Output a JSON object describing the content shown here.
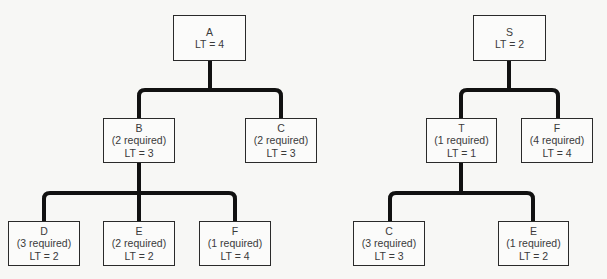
{
  "colors": {
    "line": "#111111",
    "box_border": "#2a2a2a",
    "text": "#3a3a3a",
    "background": "#f7f7f5"
  },
  "trees": [
    {
      "name": "left",
      "nodes": [
        {
          "id": "A",
          "lines": [
            "A",
            "LT = 4"
          ],
          "x": 173,
          "y": 15,
          "w": 73,
          "h": 46
        },
        {
          "id": "B",
          "lines": [
            "B",
            "(2 required)",
            "LT = 3"
          ],
          "x": 103,
          "y": 118,
          "w": 72,
          "h": 45
        },
        {
          "id": "C",
          "lines": [
            "C",
            "(2 required)",
            "LT = 3"
          ],
          "x": 245,
          "y": 118,
          "w": 72,
          "h": 45
        },
        {
          "id": "D",
          "lines": [
            "D",
            "(3 required)",
            "LT = 2"
          ],
          "x": 8,
          "y": 221,
          "w": 72,
          "h": 45
        },
        {
          "id": "E",
          "lines": [
            "E",
            "(2 required)",
            "LT = 2"
          ],
          "x": 103,
          "y": 221,
          "w": 72,
          "h": 45
        },
        {
          "id": "F",
          "lines": [
            "F",
            "(1 required)",
            "LT = 4"
          ],
          "x": 199,
          "y": 221,
          "w": 72,
          "h": 45
        }
      ]
    },
    {
      "name": "right",
      "nodes": [
        {
          "id": "S",
          "lines": [
            "S",
            "LT = 2"
          ],
          "x": 473,
          "y": 15,
          "w": 73,
          "h": 46
        },
        {
          "id": "T",
          "lines": [
            "T",
            "(1 required)",
            "LT = 1"
          ],
          "x": 426,
          "y": 118,
          "w": 71,
          "h": 45
        },
        {
          "id": "F",
          "lines": [
            "F",
            "(4 required)",
            "LT = 4"
          ],
          "x": 521,
          "y": 118,
          "w": 72,
          "h": 45
        },
        {
          "id": "C",
          "lines": [
            "C",
            "(3 required)",
            "LT = 3"
          ],
          "x": 353,
          "y": 221,
          "w": 72,
          "h": 45
        },
        {
          "id": "E",
          "lines": [
            "E",
            "(1 required)",
            "LT = 2"
          ],
          "x": 498,
          "y": 221,
          "w": 71,
          "h": 45
        }
      ]
    }
  ],
  "connectors": [
    {
      "from": "A",
      "stem_x": 210,
      "y_top": 61,
      "bar_y": 90,
      "y_bottom": 118,
      "drops": [
        139,
        281
      ]
    },
    {
      "from": "B",
      "stem_x": 139,
      "y_top": 163,
      "bar_y": 193,
      "y_bottom": 221,
      "drops": [
        44,
        139,
        235
      ]
    },
    {
      "from": "S",
      "stem_x": 509,
      "y_top": 61,
      "bar_y": 90,
      "y_bottom": 118,
      "drops": [
        461,
        558
      ]
    },
    {
      "from": "T",
      "stem_x": 461,
      "y_top": 163,
      "bar_y": 193,
      "y_bottom": 221,
      "drops": [
        390,
        533
      ]
    }
  ]
}
